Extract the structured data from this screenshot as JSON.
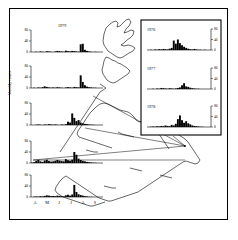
{
  "figure": {
    "axis_label_y": "Monthly counts",
    "month_ticks": [
      "A",
      "M",
      "J",
      "J",
      "A",
      "S"
    ],
    "y_ticks": [
      "80",
      "40",
      "0"
    ],
    "inset_y_ticks": [
      "80",
      "40",
      "0"
    ]
  },
  "chart_data": {
    "type": "bar",
    "xlabel": "",
    "ylabel": "Monthly counts",
    "ylim": [
      0,
      80
    ],
    "grid": false,
    "legend": "none",
    "categories": [
      "A",
      "M",
      "J",
      "J",
      "A",
      "S"
    ],
    "x_resolution": "approximately weekly bins across April-September",
    "panels": [
      {
        "name": "main-panel-1",
        "year": "1979",
        "location": "main-column",
        "ylim": [
          0,
          80
        ],
        "y_ticks": [
          0,
          40,
          80
        ],
        "values": [
          0,
          0,
          1,
          0,
          2,
          1,
          0,
          3,
          2,
          1,
          0,
          2,
          4,
          3,
          2,
          1,
          5,
          3,
          2,
          4,
          3,
          2,
          1,
          28,
          30,
          8,
          4,
          2,
          1,
          0,
          1,
          0,
          0,
          0
        ]
      },
      {
        "name": "main-panel-2",
        "year": "",
        "location": "main-column",
        "ylim": [
          0,
          80
        ],
        "y_ticks": [
          0,
          40,
          80
        ],
        "values": [
          0,
          1,
          0,
          2,
          1,
          3,
          6,
          4,
          2,
          1,
          2,
          1,
          3,
          2,
          1,
          0,
          2,
          3,
          2,
          1,
          4,
          3,
          2,
          46,
          22,
          10,
          5,
          3,
          2,
          1,
          1,
          0,
          0,
          0
        ]
      },
      {
        "name": "main-panel-3",
        "year": "",
        "location": "main-column",
        "ylim": [
          0,
          80
        ],
        "y_ticks": [
          0,
          40,
          80
        ],
        "values": [
          0,
          0,
          1,
          2,
          1,
          0,
          2,
          1,
          3,
          2,
          1,
          2,
          1,
          0,
          2,
          1,
          3,
          12,
          9,
          42,
          26,
          14,
          18,
          9,
          6,
          4,
          3,
          2,
          1,
          1,
          0,
          0,
          0,
          0
        ]
      },
      {
        "name": "main-panel-4",
        "year": "",
        "location": "main-column",
        "ylim": [
          0,
          80
        ],
        "y_ticks": [
          0,
          40,
          80
        ],
        "values": [
          1,
          3,
          8,
          11,
          6,
          4,
          9,
          12,
          7,
          5,
          6,
          8,
          11,
          9,
          7,
          6,
          14,
          10,
          8,
          12,
          40,
          30,
          16,
          11,
          8,
          6,
          4,
          3,
          2,
          1,
          1,
          0,
          0,
          0
        ]
      },
      {
        "name": "main-panel-5",
        "year": "",
        "location": "main-column",
        "ylim": [
          0,
          80
        ],
        "y_ticks": [
          0,
          40,
          80
        ],
        "values": [
          0,
          1,
          2,
          1,
          3,
          2,
          4,
          6,
          5,
          3,
          4,
          3,
          5,
          4,
          3,
          2,
          6,
          8,
          5,
          9,
          44,
          18,
          10,
          7,
          5,
          3,
          2,
          1,
          1,
          0,
          0,
          0,
          0,
          0
        ]
      },
      {
        "name": "inset-panel-1",
        "year": "1976",
        "location": "inset",
        "ylim": [
          0,
          80
        ],
        "y_ticks": [
          0,
          40,
          80
        ],
        "values": [
          0,
          1,
          0,
          2,
          1,
          3,
          2,
          4,
          3,
          2,
          5,
          8,
          36,
          24,
          40,
          26,
          18,
          12,
          8,
          5,
          3,
          2,
          4,
          2,
          1,
          1,
          0,
          1,
          0,
          0
        ]
      },
      {
        "name": "inset-panel-2",
        "year": "1977",
        "location": "inset",
        "ylim": [
          0,
          80
        ],
        "y_ticks": [
          0,
          40,
          80
        ],
        "values": [
          0,
          0,
          1,
          0,
          2,
          1,
          4,
          3,
          2,
          1,
          3,
          2,
          1,
          2,
          4,
          6,
          14,
          22,
          10,
          8,
          5,
          3,
          2,
          1,
          1,
          0,
          0,
          0,
          0,
          0
        ]
      },
      {
        "name": "inset-panel-3",
        "year": "1978",
        "location": "inset",
        "ylim": [
          0,
          80
        ],
        "y_ticks": [
          0,
          40,
          80
        ],
        "values": [
          0,
          1,
          2,
          1,
          3,
          2,
          4,
          3,
          6,
          4,
          3,
          8,
          6,
          12,
          30,
          44,
          26,
          16,
          22,
          14,
          10,
          6,
          4,
          3,
          2,
          1,
          1,
          0,
          0,
          0
        ]
      }
    ]
  }
}
